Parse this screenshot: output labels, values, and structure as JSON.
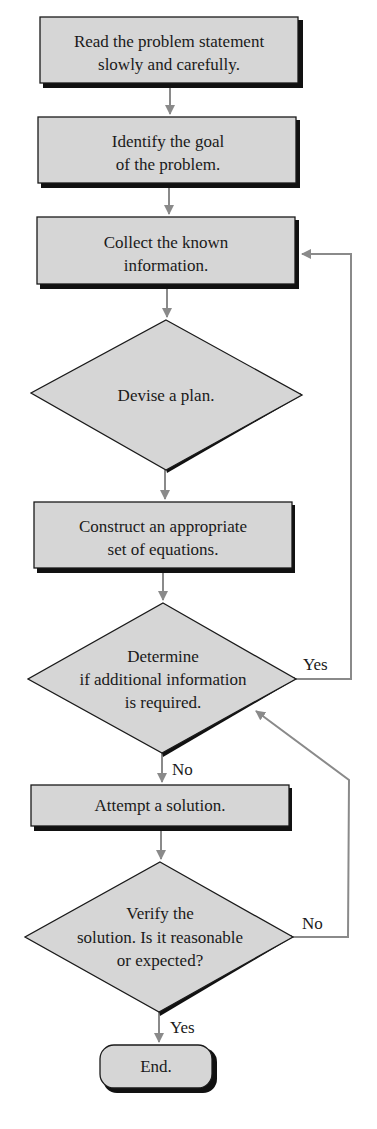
{
  "flowchart": {
    "nodes": [
      {
        "id": "read",
        "type": "process",
        "lines": [
          "Read the problem statement",
          "slowly and carefully."
        ]
      },
      {
        "id": "goal",
        "type": "process",
        "lines": [
          "Identify the goal",
          "of the problem."
        ]
      },
      {
        "id": "collect",
        "type": "process",
        "lines": [
          "Collect the known",
          "information."
        ]
      },
      {
        "id": "plan",
        "type": "decision",
        "lines": [
          "Devise a plan."
        ]
      },
      {
        "id": "equations",
        "type": "process",
        "lines": [
          "Construct an appropriate",
          "set of equations."
        ]
      },
      {
        "id": "determine",
        "type": "decision",
        "lines": [
          "Determine",
          "if additional information",
          "is required."
        ]
      },
      {
        "id": "attempt",
        "type": "process",
        "lines": [
          "Attempt a solution."
        ]
      },
      {
        "id": "verify",
        "type": "decision",
        "lines": [
          "Verify the",
          "solution. Is it reasonable",
          "or expected?"
        ]
      },
      {
        "id": "end",
        "type": "terminal",
        "lines": [
          "End."
        ]
      }
    ],
    "edge_labels": {
      "determine_yes": "Yes",
      "determine_no": "No",
      "verify_no": "No",
      "verify_yes": "Yes"
    },
    "edges": [
      {
        "from": "read",
        "to": "goal"
      },
      {
        "from": "goal",
        "to": "collect"
      },
      {
        "from": "collect",
        "to": "plan"
      },
      {
        "from": "plan",
        "to": "equations"
      },
      {
        "from": "equations",
        "to": "determine"
      },
      {
        "from": "determine",
        "to": "collect",
        "label": "Yes"
      },
      {
        "from": "determine",
        "to": "attempt",
        "label": "No"
      },
      {
        "from": "attempt",
        "to": "verify"
      },
      {
        "from": "verify",
        "to": "determine",
        "label": "No"
      },
      {
        "from": "verify",
        "to": "end",
        "label": "Yes"
      }
    ],
    "colors": {
      "fill": "#d6d6d6",
      "stroke": "#1a1a1a",
      "connector": "#8a8a8a"
    }
  }
}
